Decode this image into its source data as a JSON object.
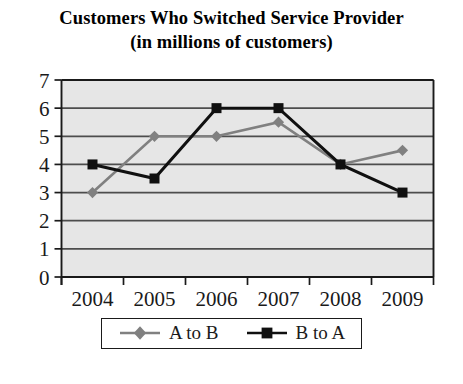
{
  "title": {
    "line1": "Customers Who Switched Service Provider",
    "line2": "(in millions of customers)"
  },
  "legend": {
    "items": [
      {
        "label": "A to B",
        "marker": "diamond-marker",
        "color": "#808080"
      },
      {
        "label": "B to A",
        "marker": "square-marker",
        "color": "#101010"
      }
    ]
  },
  "colors": {
    "plot_background": "#e6e6e6",
    "gridline": "#4d4d4d",
    "axis": "#1a1a1a",
    "series_a_to_b": "#808080",
    "series_b_to_a": "#101010"
  },
  "chart_data": {
    "type": "line",
    "title": "Customers Who Switched Service Provider (in millions of customers)",
    "xlabel": "",
    "ylabel": "",
    "categories": [
      "2004",
      "2005",
      "2006",
      "2007",
      "2008",
      "2009"
    ],
    "series": [
      {
        "name": "A to B",
        "values": [
          3,
          5,
          5,
          5.5,
          4,
          4.5
        ]
      },
      {
        "name": "B to A",
        "values": [
          4,
          3.5,
          6,
          6,
          4,
          3
        ]
      }
    ],
    "ylim": [
      0,
      7
    ],
    "ytick_labels": [
      "0",
      "1",
      "2",
      "3",
      "4",
      "5",
      "6",
      "7"
    ],
    "ytick_values": [
      0,
      1,
      2,
      3,
      4,
      5,
      6,
      7
    ],
    "grid": true,
    "legend_position": "bottom"
  }
}
